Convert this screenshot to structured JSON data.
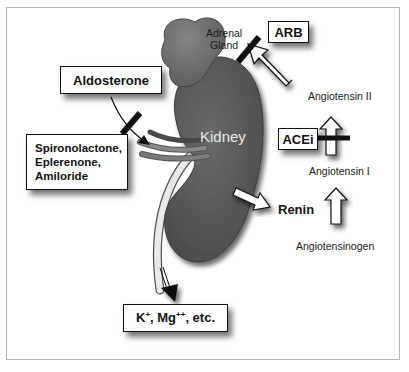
{
  "diagram": {
    "organs": {
      "adrenal_label_line1": "Adrenal",
      "adrenal_label_line2": "Gland",
      "kidney_label": "Kidney"
    },
    "boxes": {
      "aldosterone": "Aldosterone",
      "antagonists_line1": "Spironolactone,",
      "antagonists_line2": "Eplerenone,",
      "antagonists_line3": "Amiloride",
      "arb": "ARB",
      "acei": "ACEi",
      "electrolytes_k": "K",
      "electrolytes_k_sup": "+",
      "electrolytes_mg": ", Mg",
      "electrolytes_mg_sup": "++",
      "electrolytes_rest": ", etc."
    },
    "labels": {
      "angiotensin_ii": "Angiotensin II",
      "angiotensin_i": "Angiotensin I",
      "renin": "Renin",
      "angiotensinogen": "Angiotensinogen"
    },
    "colors": {
      "kidney": "#5a5a5a",
      "adrenal": "#6e6e6e",
      "frame": "#b5b5b5",
      "block_bar": "#111111"
    }
  }
}
